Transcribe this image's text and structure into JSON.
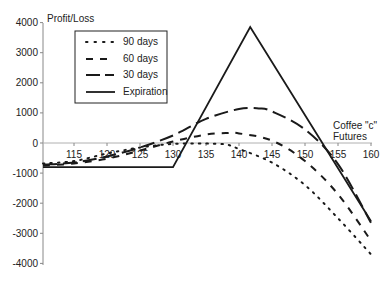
{
  "chart_data": {
    "type": "line",
    "title": "",
    "xlabel": "Coffee \"c\" Futures",
    "ylabel": "Profit/Loss",
    "xlim": [
      110.3,
      160
    ],
    "ylim": [
      -4000,
      4000
    ],
    "x_ticks": [
      115,
      120,
      125,
      130,
      135,
      140,
      145,
      150,
      155,
      160
    ],
    "y_ticks": [
      4000,
      3000,
      2000,
      1000,
      0,
      -1000,
      -2000,
      -3000,
      -4000
    ],
    "grid": false,
    "legend_position": "upper-left-inset",
    "series": [
      {
        "name": "90 days",
        "style": "dotted",
        "x": [
          110.3,
          115,
          120,
          125,
          130,
          135,
          138,
          140,
          145,
          150,
          155,
          160
        ],
        "values": [
          -680,
          -600,
          -350,
          -150,
          -30,
          -20,
          -50,
          -200,
          -650,
          -1400,
          -2500,
          -3700
        ]
      },
      {
        "name": "60 days",
        "style": "short-dash",
        "x": [
          110.3,
          115,
          120,
          125,
          130,
          135,
          138,
          140,
          145,
          150,
          155,
          160
        ],
        "values": [
          -750,
          -680,
          -520,
          -250,
          50,
          280,
          330,
          320,
          80,
          -600,
          -1700,
          -3250
        ]
      },
      {
        "name": "30 days",
        "style": "long-dash",
        "x": [
          110.3,
          115,
          120,
          125,
          130,
          135,
          140,
          143,
          145,
          150,
          155,
          160
        ],
        "values": [
          -720,
          -650,
          -450,
          -150,
          250,
          800,
          1130,
          1150,
          1050,
          450,
          -700,
          -2650
        ]
      },
      {
        "name": "Expiration",
        "style": "solid",
        "x": [
          110.3,
          130,
          141.7,
          160
        ],
        "values": [
          -800,
          -800,
          3850,
          -2600
        ]
      }
    ]
  },
  "labels": {
    "ylabel": "Profit/Loss",
    "xlabel_line1": "Coffee \"c\"",
    "xlabel_line2": "Futures"
  },
  "legend": [
    {
      "label": "90 days"
    },
    {
      "label": "60 days"
    },
    {
      "label": "30 days"
    },
    {
      "label": "Expiration"
    }
  ],
  "colors": {
    "line": "#1a1a1a",
    "axis": "#888888",
    "zero_line": "#b0b0b0"
  }
}
